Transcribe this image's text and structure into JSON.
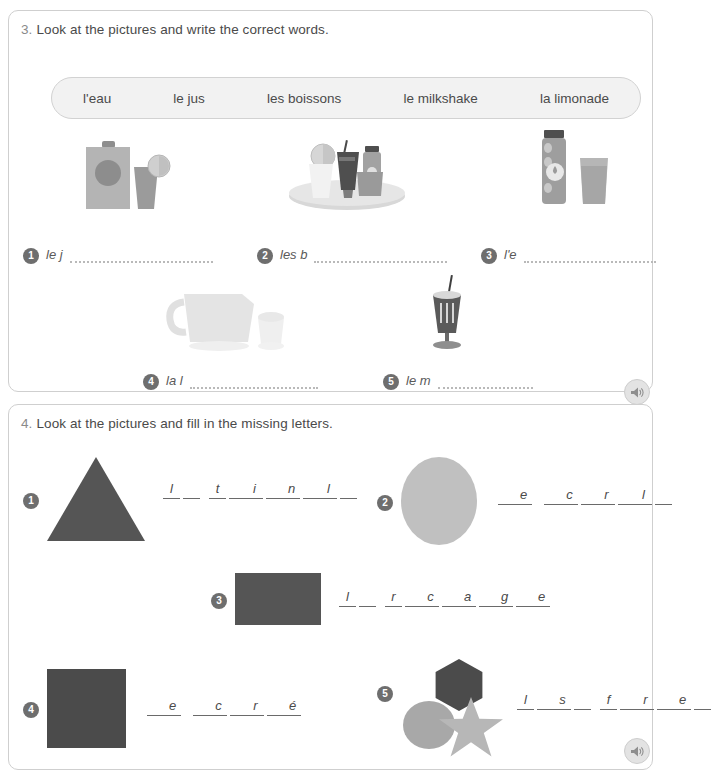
{
  "page": {
    "background": "#ffffff",
    "panel_border": "#cfcfcf",
    "text_color": "#4a4a4a",
    "badge_color": "#6e6e6e"
  },
  "exercise3": {
    "number": "3.",
    "instruction": "Look at the pictures and write the correct words.",
    "wordbank": [
      "l'eau",
      "le jus",
      "les boissons",
      "le milkshake",
      "la limonade"
    ],
    "items": [
      {
        "num": "1",
        "prompt": "le j",
        "picture": "juice-carton-and-glass-icon"
      },
      {
        "num": "2",
        "prompt": "les b",
        "picture": "tray-of-drinks-icon"
      },
      {
        "num": "3",
        "prompt": "l'e",
        "picture": "water-bottle-and-glass-icon"
      },
      {
        "num": "4",
        "prompt": "la l",
        "picture": "lemonade-jug-and-glass-icon"
      },
      {
        "num": "5",
        "prompt": "le m",
        "picture": "milkshake-glass-icon"
      }
    ],
    "audio_button": "speaker-icon"
  },
  "exercise4": {
    "number": "4.",
    "instruction": "Look at the pictures and fill in the missing letters.",
    "items": [
      {
        "num": "1",
        "shape": "triangle",
        "shape_color": "#555555",
        "groups": [
          [
            {
              "t": "l",
              "k": "ch"
            },
            {
              "t": "",
              "k": "bl"
            }
          ],
          [
            {
              "t": "t",
              "k": "ch"
            },
            {
              "t": "",
              "k": "bl"
            },
            {
              "t": "i",
              "k": "ch"
            },
            {
              "t": "",
              "k": "bl"
            },
            {
              "t": "n",
              "k": "ch"
            },
            {
              "t": "",
              "k": "bl"
            },
            {
              "t": "l",
              "k": "ch"
            },
            {
              "t": "",
              "k": "bl"
            }
          ]
        ]
      },
      {
        "num": "2",
        "shape": "circle",
        "shape_color": "#c0c0c0",
        "groups": [
          [
            {
              "t": "",
              "k": "bl"
            },
            {
              "t": "e",
              "k": "ch"
            }
          ],
          [
            {
              "t": "",
              "k": "bl"
            },
            {
              "t": "c",
              "k": "ch"
            },
            {
              "t": "",
              "k": "bl"
            },
            {
              "t": "r",
              "k": "ch"
            },
            {
              "t": "",
              "k": "bl"
            },
            {
              "t": "l",
              "k": "ch"
            },
            {
              "t": "",
              "k": "bl"
            }
          ]
        ]
      },
      {
        "num": "3",
        "shape": "rectangle",
        "shape_color": "#555555",
        "groups": [
          [
            {
              "t": "l",
              "k": "ch"
            },
            {
              "t": "",
              "k": "bl"
            }
          ],
          [
            {
              "t": "r",
              "k": "ch"
            },
            {
              "t": "",
              "k": "bl"
            },
            {
              "t": "c",
              "k": "ch"
            },
            {
              "t": "",
              "k": "bl"
            },
            {
              "t": "a",
              "k": "ch"
            },
            {
              "t": "",
              "k": "bl"
            },
            {
              "t": "g",
              "k": "ch"
            },
            {
              "t": "",
              "k": "bl"
            },
            {
              "t": "e",
              "k": "ch"
            }
          ]
        ]
      },
      {
        "num": "4",
        "shape": "square",
        "shape_color": "#4b4b4b",
        "groups": [
          [
            {
              "t": "",
              "k": "bl"
            },
            {
              "t": "e",
              "k": "ch"
            }
          ],
          [
            {
              "t": "",
              "k": "bl"
            },
            {
              "t": "c",
              "k": "ch"
            },
            {
              "t": "",
              "k": "bl"
            },
            {
              "t": "r",
              "k": "ch"
            },
            {
              "t": "",
              "k": "bl"
            },
            {
              "t": "é",
              "k": "ch"
            }
          ]
        ]
      },
      {
        "num": "5",
        "shape": "hexagon-circle-star",
        "shape_color": "#4b4b4b",
        "groups": [
          [
            {
              "t": "l",
              "k": "ch"
            },
            {
              "t": "",
              "k": "bl"
            },
            {
              "t": "s",
              "k": "ch"
            },
            {
              "t": "",
              "k": "bl"
            }
          ],
          [
            {
              "t": "f",
              "k": "ch"
            },
            {
              "t": "",
              "k": "bl"
            },
            {
              "t": "r",
              "k": "ch"
            },
            {
              "t": "",
              "k": "bl"
            },
            {
              "t": "e",
              "k": "ch"
            },
            {
              "t": "",
              "k": "bl"
            }
          ]
        ]
      }
    ],
    "audio_button": "speaker-icon"
  }
}
